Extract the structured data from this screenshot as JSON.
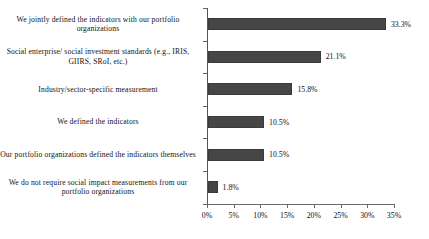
{
  "chart_data": {
    "type": "bar",
    "orientation": "horizontal",
    "title": "",
    "xlabel": "",
    "ylabel": "",
    "xlim": [
      0,
      35
    ],
    "grid": false,
    "legend": null,
    "bar_color": "#464646",
    "axis_color": "#6b6b6b",
    "categories": [
      "We jointly defined the indicators with our portfolio organizations",
      "Social enterprise/ social investment standards (e.g., IRIS, GIIRS, SRoI, etc.)",
      "Industry/sector-specific measurement",
      "We defined the indicators",
      "Our portfolio organizations defined the indicators themselves",
      "We do not require social impact measurements from our portfolio organizations"
    ],
    "values": [
      33.3,
      21.1,
      15.8,
      10.5,
      10.5,
      1.8
    ],
    "value_labels": [
      "33.3%",
      "21.1%",
      "15.8%",
      "10.5%",
      "10.5%",
      "1.8%"
    ],
    "xticks": [
      0,
      5,
      10,
      15,
      20,
      25,
      30,
      35
    ],
    "xtick_labels": [
      "0%",
      "5%",
      "10%",
      "15%",
      "20%",
      "25%",
      "30%",
      "35%"
    ]
  }
}
